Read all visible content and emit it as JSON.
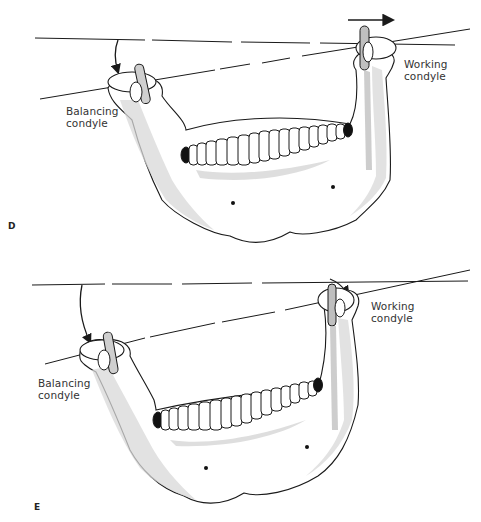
{
  "figure": {
    "panels": [
      {
        "id": "D",
        "letter": "D",
        "balancing_label_line1": "Balancing",
        "balancing_label_line2": "condyle",
        "working_label_line1": "Working",
        "working_label_line2": "condyle",
        "movement_arrow": "right-arrow"
      },
      {
        "id": "E",
        "letter": "E",
        "balancing_label_line1": "Balancing",
        "balancing_label_line2": "condyle",
        "working_label_line1": "Working",
        "working_label_line2": "condyle",
        "movement_arrow": "curved-arrow"
      }
    ],
    "colors": {
      "line": "#1a1a1a",
      "bone_fill": "#ffffff",
      "bone_shade": "#d4d4d4",
      "tooth_dark": "#111111",
      "text": "#333333"
    }
  }
}
